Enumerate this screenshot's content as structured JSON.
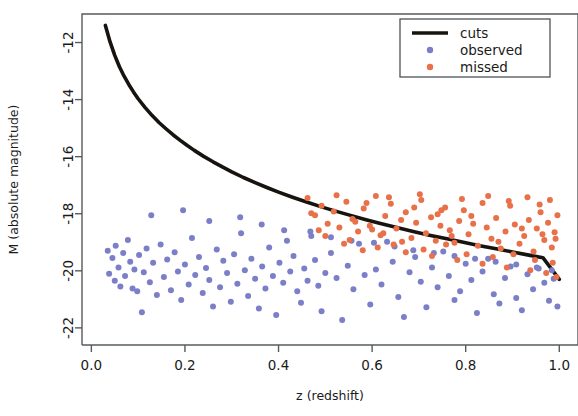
{
  "chart_data": {
    "type": "scatter",
    "title": "",
    "xlabel": "z (redshift)",
    "ylabel": "M (absolute magnitude)",
    "xlim": [
      -0.02,
      1.04
    ],
    "ylim": [
      -22.6,
      -11.0
    ],
    "xticks": [
      0.0,
      0.2,
      0.4,
      0.6,
      0.8,
      1.0
    ],
    "xtick_labels": [
      "0.0",
      "0.2",
      "0.4",
      "0.6",
      "0.8",
      "1.0"
    ],
    "yticks": [
      -12,
      -14,
      -16,
      -18,
      -20,
      -22
    ],
    "ytick_labels": [
      "-12",
      "-14",
      "-16",
      "-18",
      "-20",
      "-22"
    ],
    "grid": false,
    "legend_position": "top-right",
    "series": [
      {
        "name": "cuts",
        "type": "line",
        "color": "#17130f",
        "linewidth": 3.6,
        "points": [
          [
            0.03,
            -11.4
          ],
          [
            0.04,
            -11.98
          ],
          [
            0.05,
            -12.45
          ],
          [
            0.06,
            -12.85
          ],
          [
            0.07,
            -13.18
          ],
          [
            0.08,
            -13.47
          ],
          [
            0.09,
            -13.73
          ],
          [
            0.1,
            -13.97
          ],
          [
            0.115,
            -14.28
          ],
          [
            0.13,
            -14.56
          ],
          [
            0.145,
            -14.81
          ],
          [
            0.16,
            -15.03
          ],
          [
            0.175,
            -15.24
          ],
          [
            0.19,
            -15.43
          ],
          [
            0.205,
            -15.61
          ],
          [
            0.22,
            -15.78
          ],
          [
            0.24,
            -15.99
          ],
          [
            0.26,
            -16.18
          ],
          [
            0.28,
            -16.36
          ],
          [
            0.3,
            -16.53
          ],
          [
            0.325,
            -16.73
          ],
          [
            0.35,
            -16.91
          ],
          [
            0.375,
            -17.08
          ],
          [
            0.4,
            -17.24
          ],
          [
            0.43,
            -17.42
          ],
          [
            0.46,
            -17.59
          ],
          [
            0.49,
            -17.75
          ],
          [
            0.52,
            -17.9
          ],
          [
            0.55,
            -18.04
          ],
          [
            0.585,
            -18.2
          ],
          [
            0.62,
            -18.35
          ],
          [
            0.655,
            -18.49
          ],
          [
            0.69,
            -18.63
          ],
          [
            0.725,
            -18.76
          ],
          [
            0.76,
            -18.88
          ],
          [
            0.795,
            -19.0
          ],
          [
            0.83,
            -19.12
          ],
          [
            0.865,
            -19.23
          ],
          [
            0.9,
            -19.34
          ],
          [
            0.935,
            -19.45
          ],
          [
            0.965,
            -19.54
          ],
          [
            1.0,
            -20.3
          ]
        ]
      },
      {
        "name": "observed",
        "type": "scatter",
        "color": "#7b7fc8",
        "marker": "circle",
        "markersize": 6,
        "points": [
          [
            0.035,
            -19.3
          ],
          [
            0.038,
            -20.1
          ],
          [
            0.045,
            -19.55
          ],
          [
            0.05,
            -20.35
          ],
          [
            0.052,
            -19.12
          ],
          [
            0.058,
            -19.88
          ],
          [
            0.062,
            -20.55
          ],
          [
            0.068,
            -19.38
          ],
          [
            0.072,
            -20.18
          ],
          [
            0.078,
            -18.92
          ],
          [
            0.083,
            -19.68
          ],
          [
            0.088,
            -20.62
          ],
          [
            0.092,
            -19.95
          ],
          [
            0.098,
            -20.72
          ],
          [
            0.102,
            -19.45
          ],
          [
            0.108,
            -21.45
          ],
          [
            0.112,
            -20.05
          ],
          [
            0.118,
            -19.22
          ],
          [
            0.125,
            -20.4
          ],
          [
            0.132,
            -19.72
          ],
          [
            0.14,
            -20.85
          ],
          [
            0.148,
            -19.08
          ],
          [
            0.155,
            -20.22
          ],
          [
            0.162,
            -19.6
          ],
          [
            0.17,
            -20.68
          ],
          [
            0.178,
            -19.35
          ],
          [
            0.185,
            -20.02
          ],
          [
            0.192,
            -21.02
          ],
          [
            0.2,
            -19.78
          ],
          [
            0.208,
            -20.48
          ],
          [
            0.215,
            -18.85
          ],
          [
            0.222,
            -20.15
          ],
          [
            0.23,
            -19.52
          ],
          [
            0.238,
            -20.78
          ],
          [
            0.245,
            -19.9
          ],
          [
            0.252,
            -20.32
          ],
          [
            0.26,
            -21.25
          ],
          [
            0.268,
            -19.25
          ],
          [
            0.275,
            -20.58
          ],
          [
            0.282,
            -19.65
          ],
          [
            0.29,
            -20.08
          ],
          [
            0.298,
            -21.08
          ],
          [
            0.305,
            -19.42
          ],
          [
            0.312,
            -20.45
          ],
          [
            0.32,
            -18.68
          ],
          [
            0.328,
            -19.98
          ],
          [
            0.335,
            -20.88
          ],
          [
            0.342,
            -19.58
          ],
          [
            0.35,
            -20.28
          ],
          [
            0.358,
            -21.32
          ],
          [
            0.365,
            -19.85
          ],
          [
            0.372,
            -20.62
          ],
          [
            0.38,
            -19.18
          ],
          [
            0.388,
            -20.18
          ],
          [
            0.395,
            -21.55
          ],
          [
            0.402,
            -19.72
          ],
          [
            0.41,
            -20.42
          ],
          [
            0.418,
            -18.95
          ],
          [
            0.425,
            -20.02
          ],
          [
            0.432,
            -19.48
          ],
          [
            0.44,
            -20.72
          ],
          [
            0.448,
            -21.12
          ],
          [
            0.455,
            -19.92
          ],
          [
            0.462,
            -20.35
          ],
          [
            0.47,
            -18.78
          ],
          [
            0.478,
            -19.62
          ],
          [
            0.485,
            -20.52
          ],
          [
            0.492,
            -21.42
          ],
          [
            0.5,
            -20.08
          ],
          [
            0.512,
            -19.38
          ],
          [
            0.524,
            -20.25
          ],
          [
            0.536,
            -21.72
          ],
          [
            0.548,
            -19.82
          ],
          [
            0.56,
            -20.65
          ],
          [
            0.572,
            -19.05
          ],
          [
            0.584,
            -20.15
          ],
          [
            0.596,
            -21.18
          ],
          [
            0.608,
            -19.95
          ],
          [
            0.62,
            -20.48
          ],
          [
            0.632,
            -18.98
          ],
          [
            0.644,
            -19.68
          ],
          [
            0.656,
            -20.92
          ],
          [
            0.668,
            -21.62
          ],
          [
            0.68,
            -20.05
          ],
          [
            0.692,
            -19.52
          ],
          [
            0.704,
            -20.38
          ],
          [
            0.716,
            -21.28
          ],
          [
            0.728,
            -19.88
          ],
          [
            0.74,
            -20.58
          ],
          [
            0.752,
            -19.32
          ],
          [
            0.764,
            -20.18
          ],
          [
            0.776,
            -21.02
          ],
          [
            0.788,
            -20.72
          ],
          [
            0.8,
            -19.75
          ],
          [
            0.812,
            -20.32
          ],
          [
            0.824,
            -21.48
          ],
          [
            0.836,
            -20.02
          ],
          [
            0.848,
            -19.58
          ],
          [
            0.86,
            -20.82
          ],
          [
            0.872,
            -21.15
          ],
          [
            0.884,
            -20.25
          ],
          [
            0.896,
            -19.85
          ],
          [
            0.908,
            -20.95
          ],
          [
            0.92,
            -21.38
          ],
          [
            0.932,
            -20.12
          ],
          [
            0.944,
            -20.65
          ],
          [
            0.956,
            -19.92
          ],
          [
            0.968,
            -20.42
          ],
          [
            0.978,
            -21.05
          ],
          [
            0.988,
            -20.28
          ],
          [
            0.996,
            -21.25
          ],
          [
            0.128,
            -18.05
          ],
          [
            0.196,
            -17.88
          ],
          [
            0.252,
            -18.25
          ],
          [
            0.318,
            -18.12
          ],
          [
            0.364,
            -18.38
          ],
          [
            0.412,
            -18.58
          ],
          [
            0.468,
            -18.62
          ],
          [
            0.512,
            -18.82
          ],
          [
            0.556,
            -18.95
          ],
          [
            0.604,
            -19.02
          ],
          [
            0.648,
            -19.15
          ],
          [
            0.688,
            -19.28
          ],
          [
            0.732,
            -19.38
          ],
          [
            0.776,
            -19.48
          ],
          [
            0.82,
            -19.58
          ],
          [
            0.864,
            -19.68
          ],
          [
            0.908,
            -19.78
          ],
          [
            0.952,
            -19.88
          ],
          [
            0.984,
            -19.98
          ]
        ]
      },
      {
        "name": "missed",
        "type": "scatter",
        "color": "#e8714a",
        "marker": "circle",
        "markersize": 6,
        "points": [
          [
            0.462,
            -17.45
          ],
          [
            0.478,
            -18.05
          ],
          [
            0.492,
            -17.72
          ],
          [
            0.505,
            -18.35
          ],
          [
            0.518,
            -17.92
          ],
          [
            0.53,
            -18.48
          ],
          [
            0.545,
            -17.58
          ],
          [
            0.558,
            -18.18
          ],
          [
            0.57,
            -18.62
          ],
          [
            0.582,
            -17.82
          ],
          [
            0.595,
            -18.42
          ],
          [
            0.608,
            -17.38
          ],
          [
            0.618,
            -18.75
          ],
          [
            0.628,
            -18.08
          ],
          [
            0.64,
            -17.65
          ],
          [
            0.652,
            -18.52
          ],
          [
            0.662,
            -18.22
          ],
          [
            0.672,
            -17.95
          ],
          [
            0.684,
            -18.85
          ],
          [
            0.694,
            -18.32
          ],
          [
            0.705,
            -17.52
          ],
          [
            0.715,
            -18.68
          ],
          [
            0.726,
            -18.12
          ],
          [
            0.736,
            -18.95
          ],
          [
            0.746,
            -18.42
          ],
          [
            0.756,
            -17.78
          ],
          [
            0.766,
            -18.58
          ],
          [
            0.776,
            -19.02
          ],
          [
            0.786,
            -18.25
          ],
          [
            0.796,
            -17.88
          ],
          [
            0.806,
            -18.72
          ],
          [
            0.816,
            -18.35
          ],
          [
            0.826,
            -19.12
          ],
          [
            0.836,
            -17.62
          ],
          [
            0.845,
            -18.48
          ],
          [
            0.855,
            -18.88
          ],
          [
            0.865,
            -18.15
          ],
          [
            0.875,
            -19.22
          ],
          [
            0.885,
            -18.62
          ],
          [
            0.895,
            -17.72
          ],
          [
            0.905,
            -18.38
          ],
          [
            0.915,
            -19.05
          ],
          [
            0.925,
            -18.78
          ],
          [
            0.935,
            -18.22
          ],
          [
            0.945,
            -19.32
          ],
          [
            0.952,
            -18.52
          ],
          [
            0.96,
            -17.95
          ],
          [
            0.968,
            -18.92
          ],
          [
            0.976,
            -18.32
          ],
          [
            0.984,
            -19.18
          ],
          [
            0.99,
            -18.65
          ],
          [
            0.996,
            -18.05
          ],
          [
            0.552,
            -18.92
          ],
          [
            0.612,
            -19.18
          ],
          [
            0.672,
            -19.35
          ],
          [
            0.728,
            -19.48
          ],
          [
            0.782,
            -19.62
          ],
          [
            0.836,
            -19.75
          ],
          [
            0.888,
            -19.88
          ],
          [
            0.938,
            -19.98
          ],
          [
            0.972,
            -20.08
          ],
          [
            0.994,
            -20.22
          ],
          [
            0.588,
            -17.62
          ],
          [
            0.636,
            -17.42
          ],
          [
            0.702,
            -17.32
          ],
          [
            0.748,
            -17.88
          ],
          [
            0.792,
            -17.48
          ],
          [
            0.848,
            -17.38
          ],
          [
            0.892,
            -17.55
          ],
          [
            0.932,
            -17.42
          ],
          [
            0.958,
            -17.68
          ],
          [
            0.98,
            -17.52
          ],
          [
            0.5,
            -18.78
          ],
          [
            0.54,
            -19.05
          ],
          [
            0.58,
            -19.28
          ],
          [
            0.624,
            -18.68
          ],
          [
            0.664,
            -18.98
          ],
          [
            0.71,
            -19.25
          ],
          [
            0.758,
            -19.08
          ],
          [
            0.802,
            -19.42
          ],
          [
            0.858,
            -19.52
          ],
          [
            0.902,
            -19.42
          ],
          [
            0.948,
            -19.62
          ],
          [
            0.986,
            -19.72
          ],
          [
            0.47,
            -17.98
          ],
          [
            0.486,
            -18.58
          ],
          [
            0.524,
            -17.35
          ],
          [
            0.564,
            -18.28
          ],
          [
            0.6,
            -18.55
          ],
          [
            0.646,
            -19.08
          ],
          [
            0.69,
            -17.78
          ],
          [
            0.74,
            -18.02
          ],
          [
            0.77,
            -18.78
          ],
          [
            0.812,
            -18.08
          ],
          [
            0.87,
            -18.98
          ],
          [
            0.92,
            -18.52
          ],
          [
            0.964,
            -18.72
          ],
          [
            0.992,
            -18.88
          ]
        ]
      }
    ],
    "legend": [
      {
        "label": "cuts",
        "type": "line",
        "color": "#17130f"
      },
      {
        "label": "observed",
        "type": "marker",
        "color": "#7b7fc8"
      },
      {
        "label": "missed",
        "type": "marker",
        "color": "#e8714a"
      }
    ]
  }
}
